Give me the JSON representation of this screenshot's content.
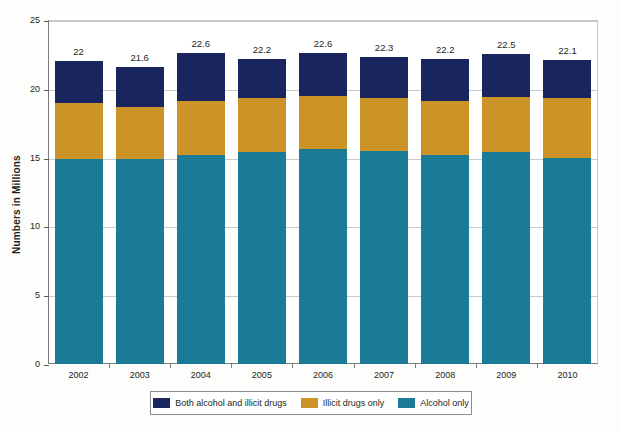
{
  "chart_data": {
    "type": "bar",
    "subtype": "stacked",
    "title": "",
    "xlabel": "",
    "ylabel": "Numbers in Millions",
    "categories": [
      "2002",
      "2003",
      "2004",
      "2005",
      "2006",
      "2007",
      "2008",
      "2009",
      "2010"
    ],
    "ylim": [
      0,
      25
    ],
    "yticks": [
      0,
      5,
      10,
      15,
      20,
      25
    ],
    "ytick_labels": [
      "0",
      "5",
      "10",
      "15",
      "20",
      "25"
    ],
    "grid": true,
    "legend_position": "bottom",
    "series": [
      {
        "name": "Alcohol only",
        "color": "#1b7a96",
        "values": [
          14.9,
          14.9,
          15.2,
          15.4,
          15.6,
          15.5,
          15.2,
          15.4,
          15.0
        ]
      },
      {
        "name": "Illicit drugs only",
        "color": "#cc9326",
        "values": [
          4.1,
          3.8,
          3.9,
          3.9,
          3.9,
          3.8,
          3.9,
          4.0,
          4.3
        ]
      },
      {
        "name": "Both alcohol and illicit drugs",
        "color": "#1a2560",
        "values": [
          3.0,
          2.9,
          3.5,
          2.9,
          3.1,
          3.0,
          3.1,
          3.1,
          2.8
        ]
      }
    ],
    "totals": [
      22,
      21.6,
      22.6,
      22.2,
      22.6,
      22.3,
      22.2,
      22.5,
      22.1
    ],
    "total_labels": [
      "22",
      "21.6",
      "22.6",
      "22.2",
      "22.6",
      "22.3",
      "22.2",
      "22.5",
      "22.1"
    ],
    "stack_order_bottom_to_top": [
      "Alcohol only",
      "Illicit drugs only",
      "Both alcohol and illicit drugs"
    ]
  },
  "legend": {
    "items": [
      {
        "label": "Both alcohol and illicit drugs",
        "color": "#1a2560"
      },
      {
        "label": "Illicit drugs only",
        "color": "#cc9326"
      },
      {
        "label": "Alcohol only",
        "color": "#1b7a96"
      }
    ]
  },
  "colors": {
    "navy": "#1a2560",
    "gold": "#cc9326",
    "teal": "#1b7a96",
    "gridline": "#9aa0a6",
    "axis": "#7b7b7b",
    "text": "#231f20",
    "background": "#fdfdfb"
  }
}
